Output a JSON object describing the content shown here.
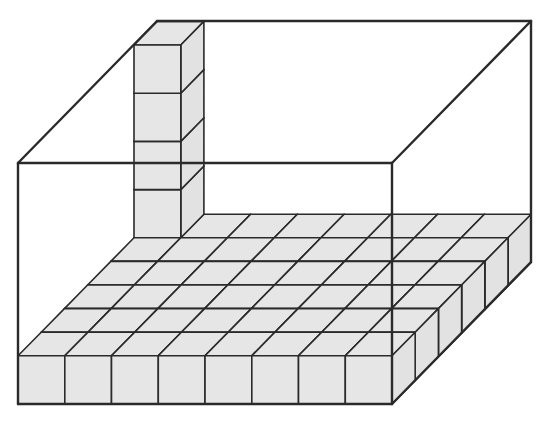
{
  "diagram": {
    "box": {
      "front_top_left": [
        18,
        163
      ],
      "front_top_right": [
        392,
        163
      ],
      "front_bottom_left": [
        18,
        404
      ],
      "front_bottom_right": [
        392,
        404
      ],
      "depth_offset": [
        139,
        -142
      ]
    },
    "cubes": {
      "columns_front": 8,
      "rows_deep": 6,
      "layers_floor": 1,
      "tower_extra_cubes": 4,
      "cube_front_width": 46.75,
      "cube_height": 48.2,
      "row_offset": [
        23.2,
        -23.6
      ]
    },
    "colors": {
      "line": "#2a2a2a",
      "cube_fill": "#e6e6e6",
      "cube_side_fill": "#e2e2e2",
      "background": "#ffffff"
    }
  }
}
